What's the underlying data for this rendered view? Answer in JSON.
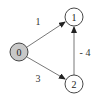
{
  "diagram": {
    "type": "directed-weighted-graph",
    "colors": {
      "source_fill": "#c8c8c8",
      "node_fill": "#ffffff",
      "stroke": "#333333",
      "edge": "#555555"
    },
    "nodes": [
      {
        "id": "0",
        "label": "0",
        "cx": 19,
        "cy": 52,
        "source": true
      },
      {
        "id": "1",
        "label": "1",
        "cx": 74,
        "cy": 17,
        "source": false
      },
      {
        "id": "2",
        "label": "2",
        "cx": 74,
        "cy": 84,
        "source": false
      }
    ],
    "edges": [
      {
        "from": "0",
        "to": "1",
        "weight": "1",
        "label_x": 38,
        "label_y": 21
      },
      {
        "from": "0",
        "to": "2",
        "weight": "3",
        "label_x": 38,
        "label_y": 78
      },
      {
        "from": "2",
        "to": "1",
        "weight": "- 4",
        "label_x": 85,
        "label_y": 52
      }
    ]
  }
}
